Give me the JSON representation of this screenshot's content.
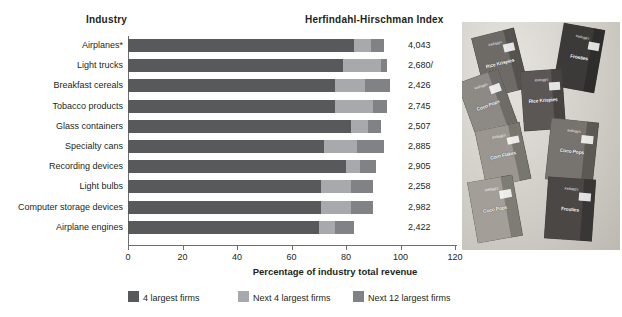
{
  "header": {
    "industry_label": "Industry",
    "hhi_label": "Herfindahl-Hirschman Index"
  },
  "axis": {
    "x_title": "Percentage of industry total revenue",
    "ticks": [
      "0",
      "20",
      "40",
      "60",
      "80",
      "100",
      "120"
    ],
    "xlim": [
      0,
      120
    ]
  },
  "legend": {
    "items": [
      {
        "label": "4 largest firms",
        "color": "#58595b"
      },
      {
        "label": "Next 4 largest firms",
        "color": "#a7a9ac"
      },
      {
        "label": "Next 12 largest firms",
        "color": "#808285"
      }
    ]
  },
  "photo": {
    "caption": "cereal-boxes-photo",
    "boxes": [
      {
        "brand": "Rice Krispies",
        "kelloggs": "Kellogg's"
      },
      {
        "brand": "Frosties",
        "kelloggs": "Kellogg's"
      },
      {
        "brand": "Coco Pops",
        "kelloggs": "Kellogg's"
      },
      {
        "brand": "Rice Krispies",
        "kelloggs": "Kellogg's"
      },
      {
        "brand": "Corn Flakes",
        "kelloggs": "Kellogg's"
      },
      {
        "brand": "Coco Pops",
        "kelloggs": "Kellogg's"
      },
      {
        "brand": "Coco Pops",
        "kelloggs": "Kellogg's"
      },
      {
        "brand": "Frosties",
        "kelloggs": "Kellogg's"
      }
    ]
  },
  "chart_data": {
    "type": "bar",
    "orientation": "horizontal",
    "stacked": true,
    "title": "",
    "xlabel": "Percentage of industry total revenue",
    "ylabel": "Industry",
    "xlim": [
      0,
      120
    ],
    "grid": false,
    "legend_position": "bottom",
    "categories": [
      "Airplanes*",
      "Light trucks",
      "Breakfast cereals",
      "Tobacco products",
      "Glass containers",
      "Specialty cans",
      "Recording devices",
      "Light bulbs",
      "Computer storage devices",
      "Airplane engines"
    ],
    "series": [
      {
        "name": "4 largest firms",
        "color": "#58595b",
        "values": [
          83,
          79,
          76,
          76,
          82,
          72,
          80,
          71,
          71,
          70
        ]
      },
      {
        "name": "Next 4 largest firms",
        "color": "#a7a9ac",
        "values": [
          6,
          14,
          11,
          14,
          6,
          12,
          5,
          11,
          11,
          6
        ]
      },
      {
        "name": "Next 12 largest firms",
        "color": "#808285",
        "values": [
          5,
          2,
          9,
          5,
          5,
          10,
          6,
          8,
          8,
          7
        ]
      }
    ],
    "hhi_values": [
      "4,043",
      "2,680/",
      "2,426",
      "2,745",
      "2,507",
      "2,885",
      "2,905",
      "2,258",
      "2,982",
      "2,422"
    ]
  }
}
